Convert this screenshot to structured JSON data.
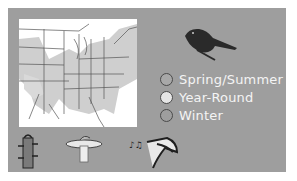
{
  "panel": {
    "background": "#9e9e9e"
  },
  "map": {
    "subject": "eastern-us-range-map",
    "range_fill": "#c8c8c8",
    "border_color": "#555555"
  },
  "bird": {
    "icon": "perched-songbird-silhouette",
    "color": "#2a2a2a"
  },
  "legend": {
    "items": [
      {
        "label": "Spring/Summer",
        "color": "#a8a8a8"
      },
      {
        "label": "Year-Round",
        "color": "#e6e6e6"
      },
      {
        "label": "Winter",
        "color": "#9e9e9e"
      }
    ]
  },
  "bottom_icons": [
    {
      "name": "tube-feeder-icon"
    },
    {
      "name": "birdbath-icon"
    },
    {
      "name": "singing-bird-icon"
    }
  ]
}
